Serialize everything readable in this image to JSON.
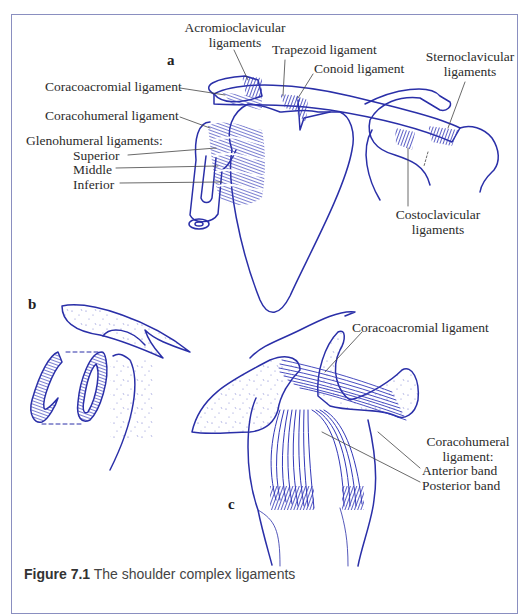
{
  "figure": {
    "panels": {
      "a": {
        "letter": "a",
        "labels": {
          "acromioclavicular": [
            "Acromioclavicular",
            "ligaments"
          ],
          "trapezoid": "Trapezoid ligament",
          "conoid": "Conoid ligament",
          "sternoclavicular": [
            "Sternoclavicular",
            "ligaments"
          ],
          "coracoacromial": "Coracoacromial ligament",
          "coracohumeral": "Coracohumeral ligament",
          "glenohumeral_heading": "Glenohumeral ligaments:",
          "glenohumeral_superior": "Superior",
          "glenohumeral_middle": "Middle",
          "glenohumeral_inferior": "Inferior",
          "costoclavicular": [
            "Costoclavicular",
            "ligaments"
          ]
        }
      },
      "b": {
        "letter": "b"
      },
      "c": {
        "letter": "c",
        "labels": {
          "coracoacromial": "Coracoacromial ligament",
          "coracohumeral": [
            "Coracohumeral",
            "ligament:"
          ],
          "anterior_band": "Anterior band",
          "posterior_band": "Posterior band"
        }
      }
    },
    "caption": {
      "number": "Figure 7.1",
      "text": "The shoulder complex ligaments"
    }
  },
  "colors": {
    "ink": "#2a2fa8",
    "ligament": "#3338b8",
    "frame": "#8a8fc0",
    "label": "#2b2b2b"
  }
}
